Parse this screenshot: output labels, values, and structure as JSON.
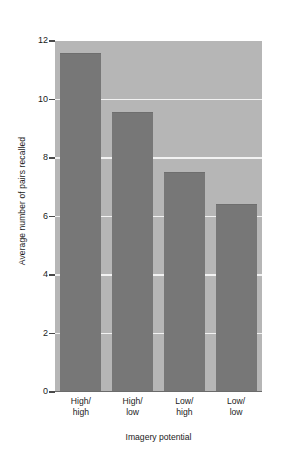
{
  "chart_data": {
    "type": "bar",
    "title": "",
    "subtitle": "",
    "xlabel": "Imagery potential",
    "ylabel": "Average number of pairs recalled",
    "categories": [
      "High/\nhigh",
      "High/\nlow",
      "Low/\nhigh",
      "Low/\nlow"
    ],
    "category_lines": [
      [
        "High/",
        "high"
      ],
      [
        "High/",
        "low"
      ],
      [
        "Low/",
        "high"
      ],
      [
        "Low/",
        "low"
      ]
    ],
    "values": [
      11.55,
      9.55,
      7.5,
      6.4
    ],
    "ylim": [
      0,
      12
    ],
    "xlim_note": "categorical",
    "yticks": [
      12,
      10,
      8,
      6,
      4,
      2,
      0
    ],
    "ytick_labels": [
      "12",
      "10",
      "8",
      "6",
      "4",
      "2",
      "0"
    ],
    "grid": true,
    "grid_axis": "y",
    "grid_color": "#f2f2f2",
    "legend": null,
    "legend_position": "none",
    "annotations": [],
    "colors": {
      "bar": "#777777",
      "plot_background": "#b6b6b6",
      "figure_background": "#ffffff",
      "gridline": "#f2f2f2",
      "axis_text": "#1b1b1b",
      "baseline": "#6b6b6b"
    }
  },
  "axes": {
    "y_title": "Average number of pairs recalled",
    "x_title": "Imagery potential"
  }
}
